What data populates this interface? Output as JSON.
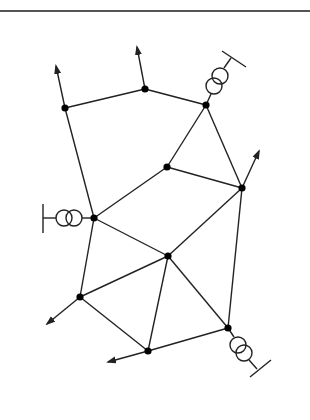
{
  "diagram": {
    "type": "power-network-graph",
    "stroke_color": "#222222",
    "rule_color": "#555555",
    "node_radius": 3.6,
    "nodes": [
      {
        "id": "N1",
        "x": 65,
        "y": 108
      },
      {
        "id": "N2",
        "x": 145,
        "y": 89
      },
      {
        "id": "N3",
        "x": 206,
        "y": 105
      },
      {
        "id": "N4",
        "x": 167,
        "y": 167
      },
      {
        "id": "N5",
        "x": 242,
        "y": 188
      },
      {
        "id": "N6",
        "x": 94,
        "y": 218
      },
      {
        "id": "N7",
        "x": 168,
        "y": 256
      },
      {
        "id": "N8",
        "x": 80,
        "y": 297
      },
      {
        "id": "N9",
        "x": 148,
        "y": 351
      },
      {
        "id": "N10",
        "x": 228,
        "y": 328
      }
    ],
    "edges": [
      [
        "N1",
        "N2"
      ],
      [
        "N2",
        "N3"
      ],
      [
        "N1",
        "N6"
      ],
      [
        "N3",
        "N4"
      ],
      [
        "N3",
        "N5"
      ],
      [
        "N4",
        "N5"
      ],
      [
        "N4",
        "N6"
      ],
      [
        "N6",
        "N7"
      ],
      [
        "N6",
        "N8"
      ],
      [
        "N5",
        "N7"
      ],
      [
        "N5",
        "N10"
      ],
      [
        "N7",
        "N8"
      ],
      [
        "N7",
        "N9"
      ],
      [
        "N7",
        "N10"
      ],
      [
        "N8",
        "N9"
      ],
      [
        "N9",
        "N10"
      ]
    ],
    "load_arrows": [
      {
        "from": "N1",
        "to": {
          "x": 56,
          "y": 66
        }
      },
      {
        "from": "N2",
        "to": {
          "x": 137,
          "y": 47
        }
      },
      {
        "from": "N5",
        "to": {
          "x": 259,
          "y": 151
        }
      },
      {
        "from": "N8",
        "to": {
          "x": 47,
          "y": 324
        }
      },
      {
        "from": "N9",
        "to": {
          "x": 108,
          "y": 362
        }
      }
    ],
    "generators": [
      {
        "at": "N3",
        "label": "transformer-generator-top-right"
      },
      {
        "at": "N6",
        "label": "transformer-generator-left"
      },
      {
        "at": "N10",
        "label": "transformer-generator-bottom-right"
      }
    ]
  }
}
